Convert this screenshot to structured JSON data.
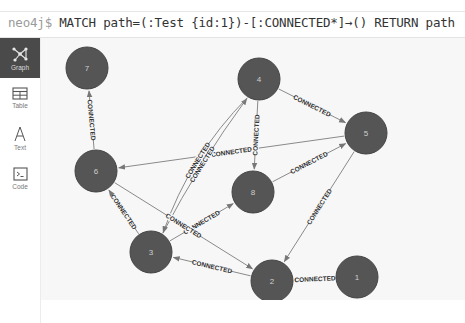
{
  "command_bar": {
    "prompt": "neo4j$",
    "query": "MATCH path=(:Test {id:1})-[:CONNECTED*]→() RETURN path"
  },
  "sidebar": {
    "items": [
      {
        "label": "Graph",
        "icon": "graph-icon",
        "active": true
      },
      {
        "label": "Table",
        "icon": "table-icon",
        "active": false
      },
      {
        "label": "Text",
        "icon": "text-icon",
        "active": false
      },
      {
        "label": "Code",
        "icon": "code-icon",
        "active": false
      }
    ]
  },
  "colors": {
    "node_fill": "#555555",
    "node_stroke": "#444444",
    "edge": "#8a8a8a",
    "canvas_bg": "#f7f7f7",
    "sidebar_active": "#4a4a4a"
  },
  "graph": {
    "nodes": [
      {
        "id": "1",
        "label": "1",
        "x": 316,
        "y": 239
      },
      {
        "id": "2",
        "label": "2",
        "x": 231,
        "y": 243
      },
      {
        "id": "3",
        "label": "3",
        "x": 110,
        "y": 214
      },
      {
        "id": "4",
        "label": "4",
        "x": 218,
        "y": 41
      },
      {
        "id": "5",
        "label": "5",
        "x": 325,
        "y": 95
      },
      {
        "id": "6",
        "label": "6",
        "x": 55,
        "y": 133
      },
      {
        "id": "7",
        "label": "7",
        "x": 46,
        "y": 30
      },
      {
        "id": "8",
        "label": "8",
        "x": 212,
        "y": 154
      }
    ],
    "relationships": [
      {
        "from": "6",
        "to": "7",
        "type": "CONNECTED"
      },
      {
        "from": "4",
        "to": "5",
        "type": "CONNECTED"
      },
      {
        "from": "5",
        "to": "6",
        "type": "CONNECTED"
      },
      {
        "from": "4",
        "to": "8",
        "type": "CONNECTED"
      },
      {
        "from": "8",
        "to": "5",
        "type": "CONNECTED"
      },
      {
        "from": "3",
        "to": "4",
        "type": "CONNECTED"
      },
      {
        "from": "4",
        "to": "3",
        "type": "CONNECTED"
      },
      {
        "from": "3",
        "to": "8",
        "type": "CONNECTED"
      },
      {
        "from": "3",
        "to": "6",
        "type": "CONNECTED"
      },
      {
        "from": "6",
        "to": "2",
        "type": "CONNECTED"
      },
      {
        "from": "2",
        "to": "3",
        "type": "CONNECTED"
      },
      {
        "from": "5",
        "to": "2",
        "type": "CONNECTED"
      },
      {
        "from": "1",
        "to": "2",
        "type": "CONNECTED"
      }
    ]
  }
}
